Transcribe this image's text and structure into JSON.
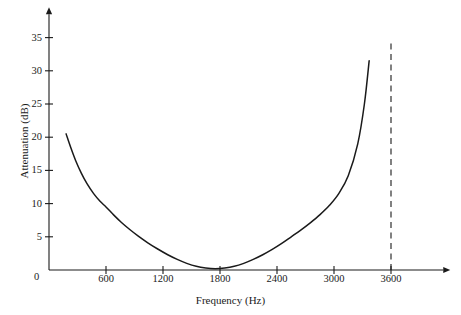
{
  "chart_data": {
    "type": "line",
    "title": "",
    "xlabel": "Frequency (Hz)",
    "ylabel": "Attenuation (dB)",
    "xlim": [
      0,
      4150
    ],
    "ylim": [
      0,
      38.5
    ],
    "grid": false,
    "legend": null,
    "xticks": [
      600,
      1200,
      1800,
      2400,
      3000,
      3600
    ],
    "xtick_labels": [
      "600",
      "1200",
      "1800",
      "2400",
      "3000",
      "3600"
    ],
    "yticks": [
      5,
      10,
      15,
      20,
      25,
      30,
      35
    ],
    "ytick_labels": [
      "5",
      "10",
      "15",
      "20",
      "25",
      "30",
      "35"
    ],
    "origin_label": "0",
    "axis_arrows": true,
    "series": [
      {
        "name": "attenuation",
        "style": "solid",
        "color": "#1a1a1a",
        "x": [
          180,
          230,
          280,
          340,
          400,
          470,
          540,
          600,
          680,
          760,
          850,
          940,
          1040,
          1140,
          1250,
          1350,
          1450,
          1550,
          1650,
          1750,
          1850,
          1950,
          2050,
          2150,
          2250,
          2350,
          2450,
          2550,
          2650,
          2750,
          2850,
          2950,
          3050,
          3150,
          3250,
          3320,
          3370
        ],
        "y": [
          20.5,
          18.4,
          16.5,
          14.6,
          13.0,
          11.5,
          10.3,
          9.5,
          8.3,
          7.2,
          6.1,
          5.1,
          4.1,
          3.2,
          2.3,
          1.6,
          1.0,
          0.55,
          0.3,
          0.2,
          0.3,
          0.55,
          1.0,
          1.6,
          2.3,
          3.1,
          4.0,
          5.0,
          6.0,
          7.1,
          8.3,
          9.7,
          11.5,
          14.2,
          19.0,
          25.0,
          31.5
        ]
      }
    ],
    "annotations": [
      {
        "name": "cutoff-line",
        "type": "vline",
        "x": 3600,
        "y_from": 0,
        "y_to": 34.6,
        "style": "dashed",
        "color": "#1a1a1a"
      }
    ]
  },
  "colors": {
    "background": "#ffffff",
    "axis": "#1a1a1a",
    "curve": "#1a1a1a",
    "dashed": "#1a1a1a"
  }
}
